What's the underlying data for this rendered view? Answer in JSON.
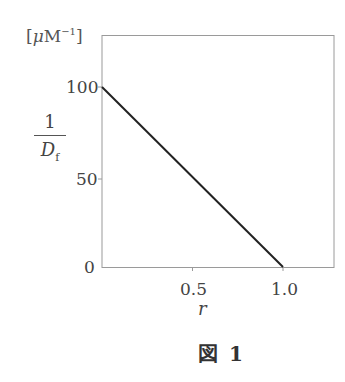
{
  "chart_data": {
    "type": "line",
    "title": "",
    "caption": "図 1",
    "xlabel": "r",
    "ylabel": "1/D_f",
    "ylabel_parts": {
      "numerator": "1",
      "denominator": "D",
      "subscript": "f"
    },
    "y_unit": "[μM⁻¹]",
    "y_unit_parts": {
      "open": "[",
      "mu": "μ",
      "M": "M",
      "exp": "−1",
      "close": "]"
    },
    "xlim": [
      0,
      1.25
    ],
    "ylim": [
      0,
      125
    ],
    "x_ticks": [
      0.5,
      1.0
    ],
    "x_tick_labels": [
      "0.5",
      "1.0"
    ],
    "y_ticks": [
      0,
      50,
      100
    ],
    "y_tick_labels": [
      "0",
      "50",
      "100"
    ],
    "grid": false,
    "legend": null,
    "series": [
      {
        "name": "1/Df vs r",
        "x": [
          0,
          1.0
        ],
        "y": [
          100,
          0
        ],
        "color": "#222222"
      }
    ]
  },
  "labels": {
    "y0": "0",
    "y50": "50",
    "y100": "100",
    "x05": "0.5",
    "x10": "1.0",
    "xlabel": "r",
    "frac_num": "1",
    "frac_den": "D",
    "frac_sub": "f",
    "unit_open": "[",
    "unit_mu": "μ",
    "unit_M": "M",
    "unit_exp": "−1",
    "unit_close": "]",
    "caption": "図 1"
  },
  "colors": {
    "line": "#222222",
    "frame": "#9a9a9a",
    "text": "#444444"
  }
}
